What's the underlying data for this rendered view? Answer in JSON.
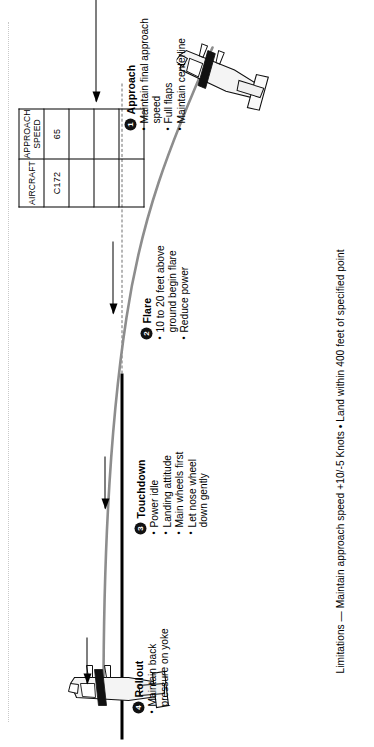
{
  "diagram": {
    "runway_label": "runway",
    "centerline_label": "extended runway centerline",
    "flight_path_color": "#8d8d8d",
    "runway_color": "#000000",
    "steps": [
      {
        "number": "1",
        "title": "Approach",
        "bullets": [
          "Maintain final approach speed",
          "Full flaps",
          "Maintain centerline"
        ]
      },
      {
        "number": "2",
        "title": "Flare",
        "bullets": [
          "10 to 20 feet above\nground begin flare",
          "Reduce power"
        ]
      },
      {
        "number": "3",
        "title": "Touchdown",
        "bullets": [
          "Power idle",
          "Landing attitude",
          "Main wheels first",
          "Let nose wheel\ndown gently"
        ]
      },
      {
        "number": "4",
        "title": "Rollout",
        "bullets": [
          "Maintain back\npressure on yoke"
        ]
      }
    ]
  },
  "table": {
    "headers": [
      "AIRCRAFT",
      "APPROACH SPEED"
    ],
    "rows": [
      [
        "C172",
        "65"
      ],
      [
        "",
        ""
      ],
      [
        "",
        ""
      ],
      [
        "",
        ""
      ]
    ]
  },
  "limitations": {
    "text": "Limitations — Maintain approach speed +10/-5 Knots • Land within 400 feet of specified point"
  }
}
